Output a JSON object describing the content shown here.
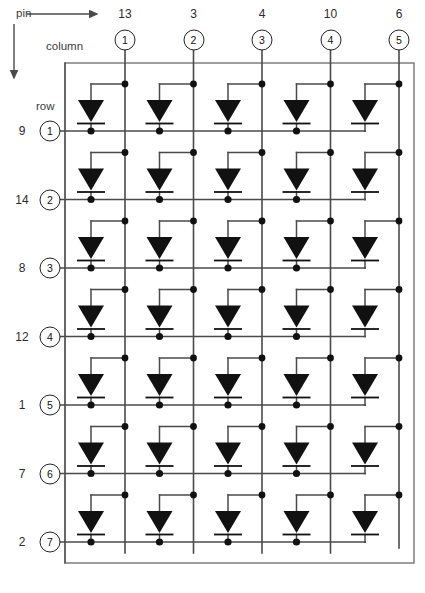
{
  "diagram": {
    "type": "led-matrix",
    "columns_count": 5,
    "rows_count": 7,
    "axis_labels": {
      "pin": "pin",
      "column": "column",
      "row": "row"
    },
    "columns": [
      {
        "index": "1",
        "pin": "13"
      },
      {
        "index": "2",
        "pin": "3"
      },
      {
        "index": "3",
        "pin": "4"
      },
      {
        "index": "4",
        "pin": "10"
      },
      {
        "index": "5",
        "pin": "6"
      }
    ],
    "rows": [
      {
        "index": "1",
        "pin": "9"
      },
      {
        "index": "2",
        "pin": "14"
      },
      {
        "index": "3",
        "pin": "8"
      },
      {
        "index": "4",
        "pin": "12"
      },
      {
        "index": "5",
        "pin": "1"
      },
      {
        "index": "6",
        "pin": "7"
      },
      {
        "index": "7",
        "pin": "2"
      }
    ],
    "colors": {
      "line": "#4a4a4a",
      "led_fill": "#111111",
      "junction": "#111111",
      "frame": "#6b6b6b",
      "text": "#2b2b2b"
    },
    "caption": ""
  }
}
